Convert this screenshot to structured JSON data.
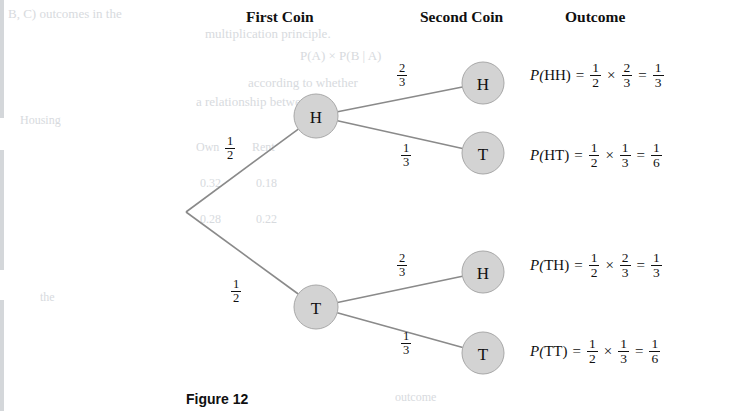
{
  "headings": [
    {
      "label": "First Coin",
      "x": 246,
      "y": 8
    },
    {
      "label": "Second Coin",
      "x": 420,
      "y": 8
    },
    {
      "label": "Outcome",
      "x": 565,
      "y": 8
    }
  ],
  "tree": {
    "root": {
      "x": 186,
      "y": 212
    },
    "nodes": [
      {
        "id": "h1",
        "label": "H",
        "x": 316,
        "y": 116,
        "r": 22
      },
      {
        "id": "t1",
        "label": "T",
        "x": 316,
        "y": 307,
        "r": 22
      },
      {
        "id": "hh",
        "label": "H",
        "x": 483,
        "y": 83,
        "r": 21
      },
      {
        "id": "ht",
        "label": "T",
        "x": 483,
        "y": 153,
        "r": 21
      },
      {
        "id": "th",
        "label": "H",
        "x": 483,
        "y": 272,
        "r": 21
      },
      {
        "id": "tt",
        "label": "T",
        "x": 483,
        "y": 353,
        "r": 21
      }
    ],
    "branch_labels": [
      {
        "id": "root-to-h",
        "num": "1",
        "den": "2",
        "x": 224,
        "y": 135
      },
      {
        "id": "root-to-t",
        "num": "1",
        "den": "2",
        "x": 230,
        "y": 278
      },
      {
        "id": "h-to-h",
        "num": "2",
        "den": "3",
        "x": 396,
        "y": 62
      },
      {
        "id": "h-to-t",
        "num": "1",
        "den": "3",
        "x": 400,
        "y": 142
      },
      {
        "id": "t-to-h",
        "num": "2",
        "den": "3",
        "x": 396,
        "y": 252
      },
      {
        "id": "t-to-t",
        "num": "1",
        "den": "3",
        "x": 400,
        "y": 330
      }
    ]
  },
  "outcomes": [
    {
      "id": "p-hh",
      "y": 61,
      "event": "HH",
      "factor1": {
        "num": "1",
        "den": "2"
      },
      "factor2": {
        "num": "2",
        "den": "3"
      },
      "result": {
        "num": "1",
        "den": "3"
      }
    },
    {
      "id": "p-ht",
      "y": 141,
      "event": "HT",
      "factor1": {
        "num": "1",
        "den": "2"
      },
      "factor2": {
        "num": "1",
        "den": "3"
      },
      "result": {
        "num": "1",
        "den": "6"
      }
    },
    {
      "id": "p-th",
      "y": 251,
      "event": "TH",
      "factor1": {
        "num": "1",
        "den": "2"
      },
      "factor2": {
        "num": "2",
        "den": "3"
      },
      "result": {
        "num": "1",
        "den": "3"
      }
    },
    {
      "id": "p-tt",
      "y": 337,
      "event": "TT",
      "factor1": {
        "num": "1",
        "den": "2"
      },
      "factor2": {
        "num": "1",
        "den": "3"
      },
      "result": {
        "num": "1",
        "den": "6"
      }
    }
  ],
  "symbols": {
    "p_open": "P(",
    "p_close": ")",
    "equals": "=",
    "times": "×"
  },
  "caption": {
    "label": "Figure 12"
  },
  "bleed_text": [
    {
      "text": "B, C) outcomes in the",
      "x": 8,
      "y": 6,
      "size": 13
    },
    {
      "text": "multiplication principle.",
      "x": 205,
      "y": 26,
      "size": 13
    },
    {
      "text": "P(A) × P(B | A)",
      "x": 300,
      "y": 48,
      "size": 13
    },
    {
      "text": "according to whether",
      "x": 248,
      "y": 75,
      "size": 13
    },
    {
      "text": "a relationship between",
      "x": 196,
      "y": 94,
      "size": 13
    },
    {
      "text": "Housing",
      "x": 20,
      "y": 113,
      "size": 12
    },
    {
      "text": "Own",
      "x": 196,
      "y": 140,
      "size": 12
    },
    {
      "text": "Rent",
      "x": 252,
      "y": 140,
      "size": 12
    },
    {
      "text": "0.32",
      "x": 200,
      "y": 176,
      "size": 12
    },
    {
      "text": "0.18",
      "x": 256,
      "y": 176,
      "size": 12
    },
    {
      "text": "0.28",
      "x": 200,
      "y": 212,
      "size": 12
    },
    {
      "text": "0.22",
      "x": 256,
      "y": 212,
      "size": 12
    },
    {
      "text": "the",
      "x": 40,
      "y": 290,
      "size": 12
    },
    {
      "text": "outcome",
      "x": 395,
      "y": 390,
      "size": 12
    }
  ],
  "colors": {
    "node_fill": "#d3d3d3",
    "node_stroke": "#a8a8a8",
    "branch_stroke": "#8a8a8a",
    "text": "#101010",
    "bleed": "#c9cdd2",
    "background": "#ffffff"
  }
}
